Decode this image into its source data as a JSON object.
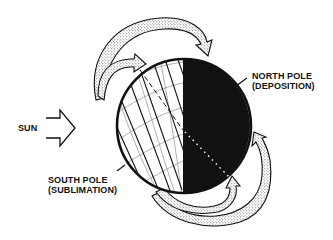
{
  "diagram": {
    "labels": {
      "sun": "SUN",
      "north_pole_line1": "NORTH POLE",
      "north_pole_line2": "(DEPOSITION)",
      "south_pole_line1": "SOUTH POLE",
      "south_pole_line2": "(SUBLIMATION)"
    },
    "colors": {
      "ink": "#111111",
      "stipple": "#d9d9d9",
      "grid": "#9a9a9a",
      "background": "#ffffff"
    },
    "elements": [
      "sun-arrows",
      "planet-globe",
      "sunlit-hemisphere-with-hatching",
      "dark-hemisphere",
      "rotation-axis",
      "upper-transport-arrows",
      "lower-transport-arrows"
    ]
  }
}
